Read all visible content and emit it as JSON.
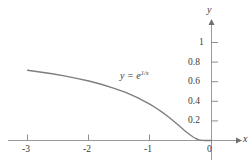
{
  "chart_data": {
    "type": "line",
    "title": "",
    "xlabel": "x",
    "ylabel": "y",
    "annotation": "y = e^(1/x)",
    "annotation_parts": {
      "lhs": "y",
      "equals": "=",
      "base": "e",
      "exponent": "1/x"
    },
    "xlim": [
      -3.1,
      0.42
    ],
    "ylim": [
      -0.12,
      1.18
    ],
    "grid": false,
    "legend": null,
    "x_ticks": [
      -3,
      -2,
      -1,
      0
    ],
    "x_tick_labels": [
      "-3",
      "-2",
      "-1",
      "0"
    ],
    "y_ticks": [
      0.2,
      0.4,
      0.6,
      0.8,
      1
    ],
    "y_tick_labels": [
      "0.2",
      "0.4",
      "0.6",
      "0.8",
      "1"
    ],
    "origin_label": "0",
    "series": [
      {
        "name": "y = e^(1/x)",
        "x": [
          -3,
          -2.8,
          -2.6,
          -2.4,
          -2.2,
          -2,
          -1.8,
          -1.6,
          -1.4,
          -1.2,
          -1,
          -0.9,
          -0.8,
          -0.7,
          -0.6,
          -0.5,
          -0.45,
          -0.4,
          -0.35,
          -0.3,
          -0.25,
          -0.2,
          -0.15,
          -0.1,
          -0.05
        ],
        "values": [
          0.717,
          0.699,
          0.681,
          0.659,
          0.634,
          0.607,
          0.574,
          0.535,
          0.49,
          0.435,
          0.368,
          0.329,
          0.287,
          0.24,
          0.189,
          0.135,
          0.108,
          0.082,
          0.058,
          0.036,
          0.018,
          0.0067,
          0.0012,
          4.54e-05,
          0.0
        ]
      }
    ],
    "colors": {
      "curve": "#7d7d82",
      "axis": "#9a9a9e",
      "text": "#3a3a3a",
      "background": "#ffffff"
    }
  },
  "axis_labels": {
    "x": "x",
    "y": "y"
  }
}
